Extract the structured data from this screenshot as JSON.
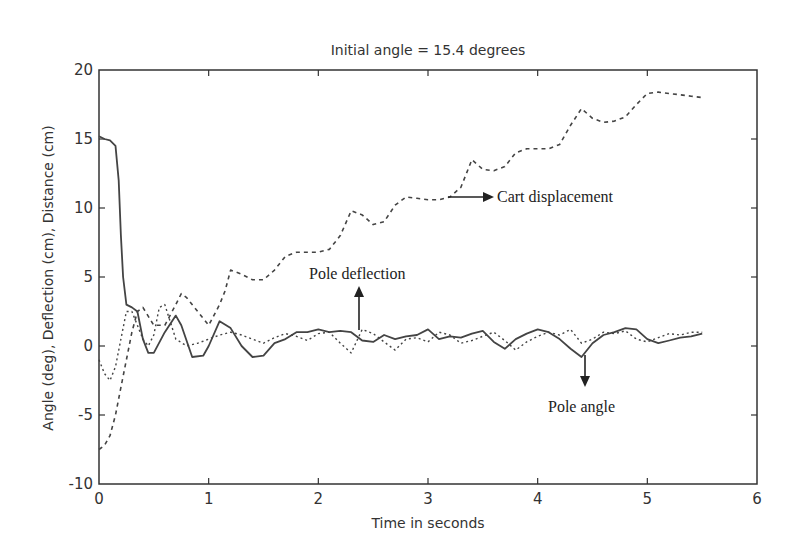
{
  "chart_data": {
    "type": "line",
    "title": "Initial angle = 15.4 degrees",
    "xlabel": "Time in seconds",
    "ylabel": "Angle (deg),  Deflection (cm),  Distance (cm)",
    "xlim": [
      0,
      6
    ],
    "ylim": [
      -10,
      20
    ],
    "xticks": [
      0,
      1,
      2,
      3,
      4,
      5,
      6
    ],
    "yticks": [
      -10,
      -5,
      0,
      5,
      10,
      15,
      20
    ],
    "xtick_labels": [
      "0",
      "1",
      "2",
      "3",
      "4",
      "5",
      "6"
    ],
    "ytick_labels": [
      "-10",
      "-5",
      "0",
      "5",
      "10",
      "15",
      "20"
    ],
    "grid": false,
    "legend": null,
    "series": [
      {
        "name": "Pole angle",
        "style": "solid",
        "x": [
          0,
          0.05,
          0.1,
          0.15,
          0.18,
          0.2,
          0.22,
          0.25,
          0.3,
          0.35,
          0.4,
          0.45,
          0.5,
          0.6,
          0.7,
          0.75,
          0.85,
          0.95,
          1.0,
          1.1,
          1.2,
          1.3,
          1.4,
          1.5,
          1.6,
          1.7,
          1.8,
          1.9,
          2.0,
          2.1,
          2.2,
          2.3,
          2.4,
          2.5,
          2.6,
          2.7,
          2.8,
          2.9,
          3.0,
          3.1,
          3.2,
          3.3,
          3.4,
          3.5,
          3.6,
          3.7,
          3.8,
          3.9,
          4.0,
          4.1,
          4.2,
          4.3,
          4.4,
          4.5,
          4.6,
          4.7,
          4.8,
          4.9,
          5.0,
          5.1,
          5.2,
          5.3,
          5.4,
          5.5
        ],
        "values": [
          15.2,
          15.0,
          14.9,
          14.5,
          12.0,
          8.0,
          5.0,
          3.0,
          2.8,
          2.5,
          0.5,
          -0.5,
          -0.5,
          1.0,
          2.2,
          1.5,
          -0.8,
          -0.7,
          0.0,
          1.8,
          1.3,
          0.0,
          -0.8,
          -0.7,
          0.2,
          0.5,
          1.0,
          1.0,
          1.2,
          1.0,
          1.1,
          1.0,
          0.4,
          0.3,
          0.8,
          0.5,
          0.7,
          0.8,
          1.2,
          0.5,
          0.7,
          0.6,
          0.9,
          1.1,
          0.3,
          -0.2,
          0.5,
          0.9,
          1.2,
          1.0,
          0.5,
          -0.2,
          -0.8,
          0.2,
          0.8,
          1.0,
          1.3,
          1.2,
          0.5,
          0.2,
          0.4,
          0.6,
          0.7,
          0.9
        ]
      },
      {
        "name": "Cart displacement",
        "style": "dashed",
        "x": [
          0,
          0.05,
          0.1,
          0.15,
          0.2,
          0.25,
          0.3,
          0.35,
          0.4,
          0.5,
          0.6,
          0.7,
          0.75,
          0.8,
          0.9,
          1.0,
          1.1,
          1.15,
          1.2,
          1.3,
          1.4,
          1.5,
          1.6,
          1.7,
          1.8,
          1.9,
          2.0,
          2.1,
          2.2,
          2.3,
          2.4,
          2.5,
          2.6,
          2.7,
          2.8,
          2.9,
          3.0,
          3.1,
          3.2,
          3.3,
          3.4,
          3.5,
          3.6,
          3.7,
          3.8,
          3.9,
          4.0,
          4.1,
          4.2,
          4.3,
          4.4,
          4.5,
          4.6,
          4.7,
          4.8,
          4.9,
          5.0,
          5.1,
          5.2,
          5.3,
          5.4,
          5.5
        ],
        "values": [
          -7.5,
          -7.2,
          -6.5,
          -5.0,
          -3.0,
          -1.0,
          1.0,
          2.5,
          2.8,
          1.5,
          1.5,
          3.0,
          3.8,
          3.5,
          2.5,
          1.5,
          3.0,
          4.0,
          5.5,
          5.2,
          4.8,
          4.8,
          5.5,
          6.5,
          6.8,
          6.8,
          6.8,
          7.0,
          8.0,
          9.8,
          9.5,
          8.8,
          9.0,
          10.2,
          10.8,
          10.7,
          10.6,
          10.6,
          10.8,
          11.5,
          13.5,
          12.8,
          12.7,
          13.0,
          14.0,
          14.3,
          14.3,
          14.3,
          14.6,
          16.0,
          17.2,
          16.5,
          16.2,
          16.3,
          16.6,
          17.5,
          18.3,
          18.4,
          18.3,
          18.2,
          18.1,
          18.0
        ]
      },
      {
        "name": "Pole deflection",
        "style": "dotted",
        "x": [
          0,
          0.05,
          0.1,
          0.15,
          0.2,
          0.25,
          0.3,
          0.35,
          0.4,
          0.45,
          0.5,
          0.55,
          0.6,
          0.7,
          0.8,
          0.9,
          1.0,
          1.1,
          1.2,
          1.3,
          1.4,
          1.5,
          1.6,
          1.7,
          1.8,
          1.9,
          2.0,
          2.1,
          2.2,
          2.3,
          2.4,
          2.5,
          2.6,
          2.7,
          2.8,
          2.9,
          3.0,
          3.1,
          3.2,
          3.3,
          3.4,
          3.5,
          3.6,
          3.7,
          3.8,
          3.9,
          4.0,
          4.1,
          4.2,
          4.3,
          4.4,
          4.5,
          4.6,
          4.7,
          4.8,
          4.9,
          5.0,
          5.1,
          5.2,
          5.3,
          5.4,
          5.5
        ],
        "values": [
          -1.0,
          -2.0,
          -2.5,
          -1.5,
          0.5,
          2.5,
          2.5,
          1.5,
          0.5,
          0.0,
          0.8,
          2.8,
          3.0,
          0.5,
          0.0,
          0.2,
          0.5,
          0.8,
          1.0,
          0.8,
          0.5,
          0.2,
          0.6,
          0.9,
          0.7,
          0.4,
          0.9,
          1.0,
          0.2,
          -0.5,
          1.2,
          0.9,
          0.3,
          -0.3,
          0.5,
          0.6,
          0.3,
          1.0,
          0.8,
          0.2,
          0.4,
          0.7,
          1.0,
          0.4,
          -0.3,
          0.3,
          0.7,
          1.0,
          0.8,
          1.2,
          0.2,
          0.5,
          1.0,
          0.9,
          1.1,
          0.5,
          0.3,
          0.6,
          0.9,
          0.8,
          1.0,
          1.0
        ]
      }
    ],
    "annotations": [
      {
        "text": "Cart displacement",
        "arrow": "right",
        "x": 3.2,
        "y": 10.8
      },
      {
        "text": "Pole deflection",
        "arrow": "up",
        "x": 2.37,
        "y": 1.2
      },
      {
        "text": "Pole angle",
        "arrow": "down",
        "x": 4.43,
        "y": -0.8
      }
    ]
  },
  "figure": {
    "title": "Initial angle = 15.4 degrees",
    "xlabel": "Time in seconds",
    "ylabel": "Angle (deg),  Deflection (cm),  Distance (cm)",
    "annotation_cart": "Cart displacement",
    "annotation_deflection": "Pole deflection",
    "annotation_angle": "Pole angle",
    "line_color": "#444444",
    "axis_color": "#333333"
  }
}
